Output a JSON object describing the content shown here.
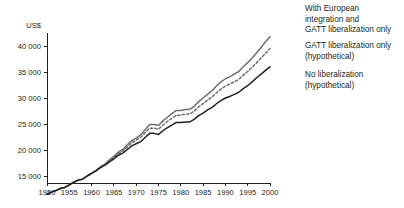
{
  "chart": {
    "unit_label": "US$",
    "y_ticks": [
      "15 000",
      "20 000",
      "25 000",
      "30 000",
      "35 000",
      "40 000"
    ],
    "x_ticks": [
      "1950",
      "1955",
      "1960",
      "1965",
      "1970",
      "1975",
      "1980",
      "1985",
      "1990",
      "1995",
      "2000"
    ],
    "colors": {
      "with_european_integration": "#6d6e71",
      "gatt_only": "#6d6e71",
      "no_liberalization": "#231f20",
      "axis": "#231f20"
    }
  },
  "legend": {
    "top": "With European\nintegration and\nGATT liberalization only",
    "middle": "GATT liberalization only\n(hypothetical)",
    "bottom": "No liberalization\n(hypothetical)"
  },
  "chart_data": {
    "type": "line",
    "title": "",
    "xlabel": "",
    "ylabel": "US$",
    "xlim": [
      1950,
      2000
    ],
    "ylim": [
      11000,
      42500
    ],
    "grid": false,
    "legend_position": "right",
    "x": [
      1950,
      1951,
      1952,
      1953,
      1954,
      1955,
      1956,
      1957,
      1958,
      1959,
      1960,
      1961,
      1962,
      1963,
      1964,
      1965,
      1966,
      1967,
      1968,
      1969,
      1970,
      1971,
      1972,
      1973,
      1974,
      1975,
      1976,
      1977,
      1978,
      1979,
      1980,
      1981,
      1982,
      1983,
      1984,
      1985,
      1986,
      1987,
      1988,
      1989,
      1990,
      1991,
      1992,
      1993,
      1994,
      1995,
      1996,
      1997,
      1998,
      1999,
      2000
    ],
    "series": [
      {
        "name": "With European integration and GATT liberalization only",
        "style": "solid",
        "color": "#6d6e71",
        "values": [
          11500,
          11900,
          12200,
          12600,
          12800,
          13300,
          13800,
          14200,
          14400,
          15000,
          15500,
          16100,
          16800,
          17300,
          18100,
          18800,
          19600,
          20100,
          21000,
          21800,
          22300,
          22900,
          23900,
          24900,
          24900,
          24700,
          25600,
          26300,
          27000,
          27600,
          27600,
          27800,
          27800,
          28400,
          29300,
          30000,
          30700,
          31400,
          32300,
          33100,
          33700,
          34100,
          34600,
          35100,
          36000,
          36800,
          37700,
          38700,
          39700,
          40800,
          41800
        ]
      },
      {
        "name": "GATT liberalization only (hypothetical)",
        "style": "dashed",
        "color": "#6d6e71",
        "values": [
          11500,
          11900,
          12200,
          12600,
          12800,
          13300,
          13800,
          14200,
          14400,
          15000,
          15500,
          16100,
          16700,
          17200,
          17900,
          18600,
          19300,
          19800,
          20600,
          21400,
          21900,
          22400,
          23300,
          24200,
          24200,
          24000,
          24800,
          25500,
          26100,
          26700,
          26700,
          26900,
          26900,
          27500,
          28300,
          28900,
          29600,
          30200,
          31000,
          31700,
          32300,
          32700,
          33100,
          33600,
          34400,
          35100,
          35900,
          36800,
          37700,
          38600,
          39500
        ]
      },
      {
        "name": "No liberalization (hypothetical)",
        "style": "solid",
        "color": "#231f20",
        "values": [
          11500,
          11900,
          12200,
          12600,
          12800,
          13300,
          13800,
          14200,
          14400,
          15000,
          15500,
          16000,
          16600,
          17100,
          17700,
          18300,
          19000,
          19400,
          20100,
          20800,
          21200,
          21600,
          22400,
          23200,
          23200,
          23000,
          23700,
          24300,
          24800,
          25300,
          25300,
          25400,
          25400,
          25900,
          26600,
          27100,
          27700,
          28200,
          28900,
          29500,
          30000,
          30300,
          30700,
          31100,
          31800,
          32400,
          33100,
          33900,
          34600,
          35300,
          36000
        ]
      }
    ]
  }
}
